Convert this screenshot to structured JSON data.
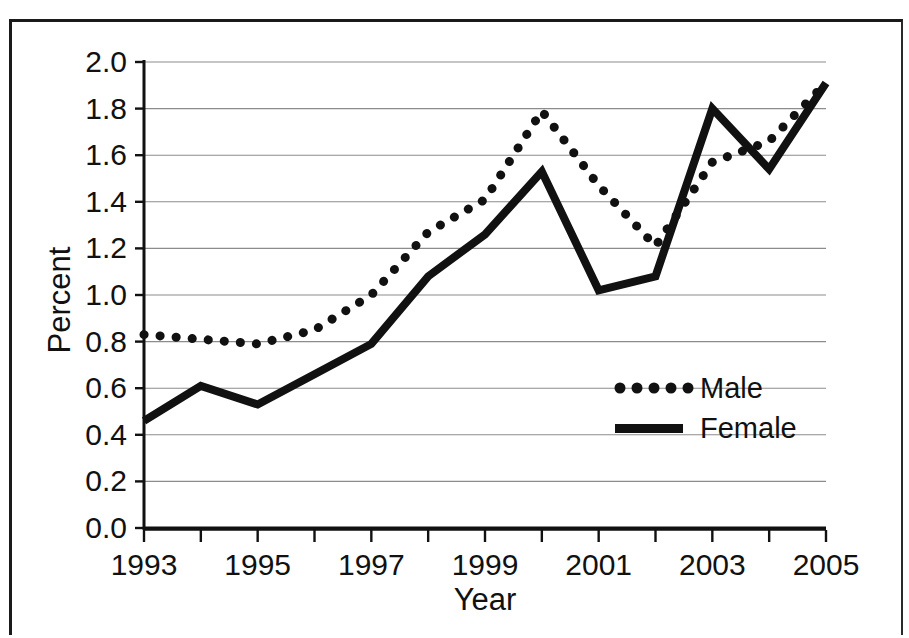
{
  "chart_data": {
    "type": "line",
    "title": "",
    "xlabel": "Year",
    "ylabel": "Percent",
    "xlim": [
      1993,
      2005
    ],
    "ylim": [
      0.0,
      2.0
    ],
    "grid": true,
    "legend_position": "inside-lower-right",
    "x": [
      1993,
      1994,
      1995,
      1996,
      1997,
      1998,
      1999,
      2000,
      2001,
      2002,
      2003,
      2004,
      2005
    ],
    "xtick_labels": [
      "1993",
      "1995",
      "1997",
      "1999",
      "2001",
      "2003",
      "2005"
    ],
    "xtick_values": [
      1993,
      1995,
      1997,
      1999,
      2001,
      2003,
      2005
    ],
    "ytick_labels": [
      "0.0",
      "0.2",
      "0.4",
      "0.6",
      "0.8",
      "1.0",
      "1.2",
      "1.4",
      "1.6",
      "1.8",
      "2.0"
    ],
    "ytick_values": [
      0.0,
      0.2,
      0.4,
      0.6,
      0.8,
      1.0,
      1.2,
      1.4,
      1.6,
      1.8,
      2.0
    ],
    "series": [
      {
        "name": "Male",
        "style": "dotted",
        "color": "#111111",
        "values": [
          0.83,
          0.81,
          0.79,
          0.85,
          1.0,
          1.27,
          1.41,
          1.79,
          1.47,
          1.21,
          1.57,
          1.66,
          1.91
        ]
      },
      {
        "name": "Female",
        "style": "solid",
        "color": "#111111",
        "values": [
          0.46,
          0.61,
          0.53,
          0.66,
          0.79,
          1.08,
          1.26,
          1.53,
          1.02,
          1.08,
          1.8,
          1.54,
          1.91
        ]
      }
    ]
  },
  "legend": {
    "entries": [
      {
        "label": "Male",
        "marker": "dotted-line-swatch"
      },
      {
        "label": "Female",
        "marker": "solid-line-swatch"
      }
    ]
  },
  "axes": {
    "x_title": "Year",
    "y_title": "Percent"
  }
}
